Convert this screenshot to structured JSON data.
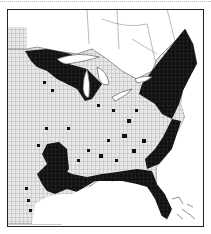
{
  "map": {
    "type": "county distribution map",
    "region": "Eastern United States",
    "legend": [],
    "colors": {
      "background": "#ffffff",
      "frame": "#222222",
      "county_grid": "#9a9a9a",
      "land_base": "#e6e6e6",
      "occupied_counties": "#111111",
      "water": "#ffffff",
      "canada": "#ffffff"
    },
    "shaded_regions": [
      "Upper Great Lakes (MN, WI, MI Upper Peninsula)",
      "Lower Michigan (scattered)",
      "New England and New York",
      "Pennsylvania, New Jersey, Atlantic coastal plain",
      "Appalachian scattered counties",
      "Southeastern coastal plain (GA, SC, NC)",
      "Florida",
      "Gulf coast (LA, MS, AL)",
      "East Texas (scattered)"
    ]
  }
}
